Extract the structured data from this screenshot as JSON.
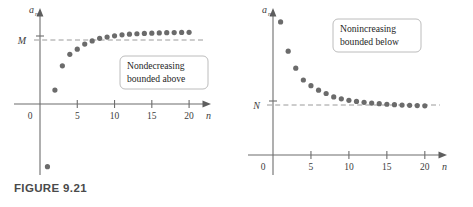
{
  "figure": {
    "caption": "FIGURE 9.21",
    "colors": {
      "dot": "#6b6b6b",
      "axis": "#6d6d6d",
      "dashed_bound": "#9a9a9a",
      "callout_border": "#b4b4b4",
      "caption_text": "#4a4a4a",
      "background": "#ffffff"
    }
  },
  "chart_data": [
    {
      "id": "nondecreasing-bounded-above",
      "type": "scatter",
      "title": "",
      "xlabel": "n",
      "ylabel": "a_n",
      "ylabel_base": "a",
      "ylabel_sub": "n",
      "xlim": [
        0,
        22
      ],
      "ylim": [
        -1.35,
        1.25
      ],
      "xticks": [
        5,
        10,
        15,
        20
      ],
      "xticklabels": [
        "5",
        "10",
        "15",
        "20"
      ],
      "origin_label": "0",
      "grid": false,
      "bound": {
        "label": "M",
        "value": 1.0,
        "style": "dashed",
        "position": "horizontal"
      },
      "annotation": {
        "line1": "Nondecreasing",
        "line2": "bounded above"
      },
      "x": [
        1,
        2,
        3,
        4,
        5,
        6,
        7,
        8,
        9,
        10,
        11,
        12,
        13,
        14,
        15,
        16,
        17,
        18,
        19,
        20
      ],
      "values": [
        -1.22,
        -0.02,
        0.36,
        0.54,
        0.62,
        0.7,
        0.75,
        0.79,
        0.81,
        0.83,
        0.845,
        0.855,
        0.862,
        0.868,
        0.872,
        0.876,
        0.879,
        0.881,
        0.883,
        0.885
      ]
    },
    {
      "id": "nonincreasing-bounded-below",
      "type": "scatter",
      "title": "",
      "xlabel": "n",
      "ylabel": "a_n",
      "ylabel_base": "a",
      "ylabel_sub": "n",
      "xlim": [
        0,
        22
      ],
      "ylim": [
        0,
        1.25
      ],
      "xticks": [
        5,
        10,
        15,
        20
      ],
      "xticklabels": [
        "5",
        "10",
        "15",
        "20"
      ],
      "origin_label": "0",
      "grid": false,
      "bound": {
        "label": "N",
        "value": 0.34,
        "style": "dashed",
        "position": "horizontal"
      },
      "annotation": {
        "line1": "Nonincreasing",
        "line2": "bounded below"
      },
      "x": [
        1,
        2,
        3,
        4,
        5,
        6,
        7,
        8,
        9,
        10,
        11,
        12,
        13,
        14,
        15,
        16,
        17,
        18,
        19,
        20
      ],
      "values": [
        1.18,
        0.92,
        0.77,
        0.665,
        0.615,
        0.575,
        0.545,
        0.515,
        0.498,
        0.485,
        0.475,
        0.467,
        0.46,
        0.455,
        0.45,
        0.446,
        0.443,
        0.44,
        0.438,
        0.436
      ]
    }
  ]
}
